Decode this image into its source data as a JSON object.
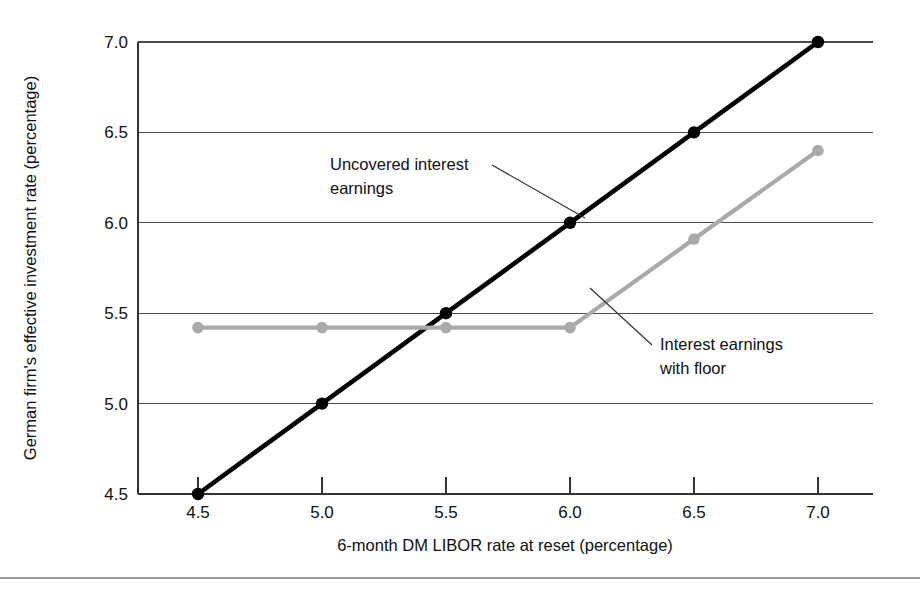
{
  "chart_data": {
    "type": "line",
    "title": "",
    "xlabel": "6-month DM LIBOR rate at reset (percentage)",
    "ylabel": "German firm's effective investment rate (percentage)",
    "x": [
      4.5,
      5.0,
      5.5,
      6.0,
      6.5,
      7.0
    ],
    "xlim": [
      4.5,
      7.0
    ],
    "ylim": [
      4.5,
      7.0
    ],
    "xticks": [
      "4.5",
      "5.0",
      "5.5",
      "6.0",
      "6.5",
      "7.0"
    ],
    "yticks": [
      "4.5",
      "5.0",
      "5.5",
      "6.0",
      "6.5",
      "7.0"
    ],
    "grid": "horizontal",
    "legend_position": "inline-annotations",
    "series": [
      {
        "name": "Uncovered interest earnings",
        "color": "#000000",
        "values": [
          4.5,
          5.0,
          5.5,
          6.0,
          6.5,
          7.0
        ]
      },
      {
        "name": "Interest earnings with floor",
        "color": "#aaaaaa",
        "values": [
          5.42,
          5.42,
          5.42,
          5.42,
          5.91,
          6.4
        ]
      }
    ],
    "annotations": [
      {
        "id": "uncovered",
        "lines": [
          "Uncovered interest",
          "earnings"
        ],
        "text_x": 330,
        "text_y": 170,
        "leader_from_x": 492,
        "leader_from_y": 165,
        "leader_to_x": 585,
        "leader_to_y": 218
      },
      {
        "id": "floor",
        "lines": [
          "Interest earnings",
          "with floor"
        ],
        "text_x": 660,
        "text_y": 350,
        "leader_from_x": 652,
        "leader_from_y": 345,
        "leader_to_x": 590,
        "leader_to_y": 288
      }
    ]
  },
  "axes_geometry": {
    "plot_left": 138,
    "plot_right": 873,
    "plot_top": 42,
    "plot_bottom": 494
  },
  "decorations": {
    "bottom_rule_y": 578
  }
}
